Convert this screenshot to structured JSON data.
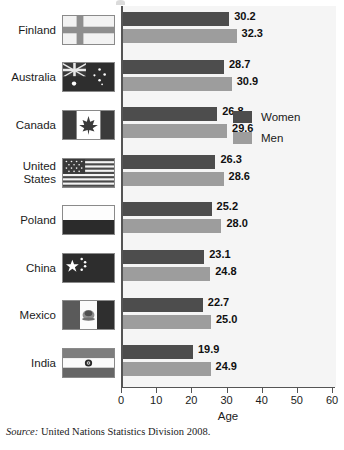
{
  "chart_data": {
    "type": "bar",
    "orientation": "horizontal",
    "title": "",
    "xlabel": "Age",
    "ylabel": "",
    "xlim": [
      0,
      60
    ],
    "xticks": [
      0,
      10,
      20,
      30,
      40,
      50,
      60
    ],
    "grid": false,
    "legend_position": "inside-right",
    "categories": [
      "Finland",
      "Australia",
      "Canada",
      "United\nStates",
      "Poland",
      "China",
      "Mexico",
      "India"
    ],
    "series": [
      {
        "name": "Women",
        "color": "#4d4d4d",
        "values": [
          30.2,
          28.7,
          26.8,
          26.3,
          25.2,
          23.1,
          22.7,
          19.9
        ]
      },
      {
        "name": "Men",
        "color": "#9d9d9d",
        "values": [
          32.3,
          30.9,
          29.6,
          28.6,
          28.0,
          24.8,
          25.0,
          24.9
        ]
      }
    ],
    "value_labels": [
      {
        "category": "Finland",
        "women": "30.2",
        "men": "32.3"
      },
      {
        "category": "Australia",
        "women": "28.7",
        "men": "30.9"
      },
      {
        "category": "Canada",
        "women": "26.8",
        "men": "29.6"
      },
      {
        "category": "United States",
        "women": "26.3",
        "men": "28.6"
      },
      {
        "category": "Poland",
        "women": "25.2",
        "men": "28.0"
      },
      {
        "category": "China",
        "women": "23.1",
        "men": "24.8"
      },
      {
        "category": "Mexico",
        "women": "22.7",
        "men": "25.0"
      },
      {
        "category": "India",
        "women": "19.9",
        "men": "24.9"
      }
    ]
  },
  "rows": [
    {
      "label": "Finland",
      "flag": "flag-finland",
      "women_value": "30.2",
      "men_value": "32.3",
      "women_num": 30.2,
      "men_num": 32.3
    },
    {
      "label": "Australia",
      "flag": "flag-australia",
      "women_value": "28.7",
      "men_value": "30.9",
      "women_num": 28.7,
      "men_num": 30.9
    },
    {
      "label": "Canada",
      "flag": "flag-canada",
      "women_value": "26.8",
      "men_value": "29.6",
      "women_num": 26.8,
      "men_num": 29.6
    },
    {
      "label": "United\nStates",
      "flag": "flag-usa",
      "women_value": "26.3",
      "men_value": "28.6",
      "women_num": 26.3,
      "men_num": 28.6
    },
    {
      "label": "Poland",
      "flag": "flag-poland",
      "women_value": "25.2",
      "men_value": "28.0",
      "women_num": 25.2,
      "men_num": 28.0
    },
    {
      "label": "China",
      "flag": "flag-china",
      "women_value": "23.1",
      "men_value": "24.8",
      "women_num": 23.1,
      "men_num": 24.8
    },
    {
      "label": "Mexico",
      "flag": "flag-mexico",
      "women_value": "22.7",
      "men_value": "25.0",
      "women_num": 22.7,
      "men_num": 25.0
    },
    {
      "label": "India",
      "flag": "flag-india",
      "women_value": "19.9",
      "men_value": "24.9",
      "women_num": 19.9,
      "men_num": 24.9
    }
  ],
  "legend": {
    "items": [
      {
        "label": "Women",
        "color": "#4d4d4d"
      },
      {
        "label": "Men",
        "color": "#9d9d9d"
      }
    ]
  },
  "axis": {
    "title": "Age",
    "ticks": [
      "0",
      "10",
      "20",
      "30",
      "40",
      "50",
      "60"
    ],
    "min": 0,
    "max": 60
  },
  "source": {
    "prefix": "Source:",
    "text": "United Nations Statistics Division 2008."
  },
  "colors": {
    "women": "#4d4d4d",
    "men": "#9d9d9d",
    "plot_background": "#f5f5f5",
    "axis": "#555555"
  }
}
